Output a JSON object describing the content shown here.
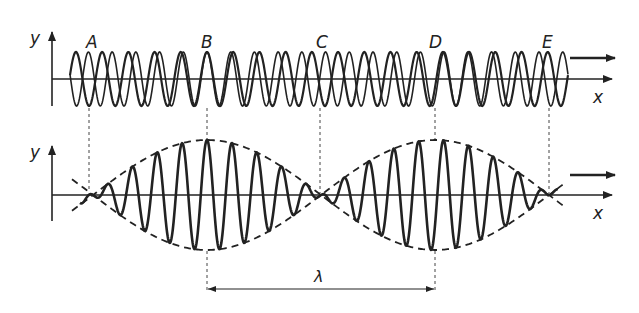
{
  "figure": {
    "top_panel": {
      "y_axis_label": "y",
      "x_axis_label": "x",
      "point_labels": [
        "A",
        "B",
        "C",
        "D",
        "E"
      ],
      "waves": [
        {
          "name": "wave-1",
          "cycles": 19
        },
        {
          "name": "wave-2",
          "cycles": 21
        }
      ]
    },
    "bottom_panel": {
      "y_axis_label": "y",
      "x_axis_label": "x",
      "envelope_style": "dashed",
      "carrier_cycles": 20,
      "wavelength_label": "λ"
    },
    "colors": {
      "stroke": "#222222",
      "background": "#ffffff"
    }
  }
}
